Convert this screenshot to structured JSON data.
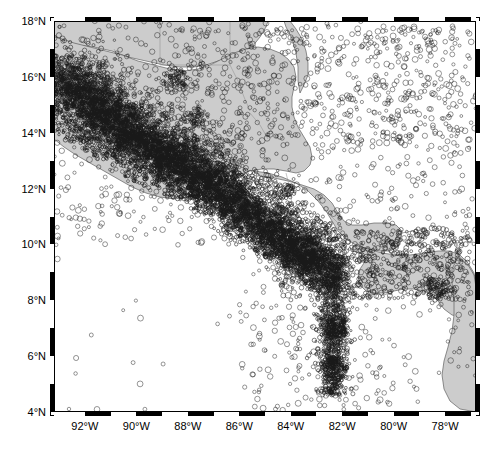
{
  "figure": {
    "kind": "seismicity-map",
    "region": "Central America",
    "background_color": "#ffffff",
    "land_color": "#cccccc",
    "coast_line_color": "#4a4a4a",
    "epicenter_symbol": "open-circle",
    "epicenter_color": "#1a1a1a"
  },
  "axes": {
    "x": {
      "label": "",
      "unit": "degrees-west",
      "min": -93.2,
      "max": -76.8,
      "tick_labels": [
        "92°W",
        "90°W",
        "88°W",
        "86°W",
        "84°W",
        "82°W",
        "80°W",
        "78°W"
      ],
      "tick_values": [
        -92,
        -90,
        -88,
        -86,
        -84,
        -82,
        -80,
        -78
      ],
      "minor_tick_interval": 1
    },
    "y": {
      "label": "",
      "unit": "degrees-north",
      "min": 4,
      "max": 18,
      "tick_labels": [
        "4°N",
        "6°N",
        "8°N",
        "10°N",
        "12°N",
        "14°N",
        "16°N",
        "18°N"
      ],
      "tick_values": [
        4,
        6,
        8,
        10,
        12,
        14,
        16,
        18
      ],
      "minor_tick_interval": 1
    }
  },
  "chart_data": {
    "type": "scatter",
    "title": "",
    "xlabel": "",
    "ylabel": "",
    "xlim": [
      -93.2,
      -76.8
    ],
    "ylim": [
      4,
      18
    ],
    "grid": false,
    "legend": null,
    "series": [
      {
        "name": "Earthquake epicenters",
        "marker": "o",
        "filled": false,
        "color": "#1a1a1a",
        "description": "Dense NW-SE band of epicenters along the Middle America Trench from 16°N/93°W to 10°N/84°W, a N-S strand near 82°W from 5°N to 10°N, and scattered events across the Caribbean and Pacific.",
        "clusters": [
          {
            "center_lon": -92.2,
            "center_lat": 15.0,
            "radius_deg": 1.6,
            "count": 900,
            "density": "very-high"
          },
          {
            "center_lon": -91.0,
            "center_lat": 14.2,
            "radius_deg": 1.4,
            "count": 800,
            "density": "very-high"
          },
          {
            "center_lon": -89.6,
            "center_lat": 13.2,
            "radius_deg": 1.3,
            "count": 700,
            "density": "very-high"
          },
          {
            "center_lon": -88.2,
            "center_lat": 12.6,
            "radius_deg": 1.2,
            "count": 620,
            "density": "very-high"
          },
          {
            "center_lon": -86.9,
            "center_lat": 11.9,
            "radius_deg": 1.1,
            "count": 560,
            "density": "high"
          },
          {
            "center_lon": -85.8,
            "center_lat": 11.0,
            "radius_deg": 1.0,
            "count": 460,
            "density": "high"
          },
          {
            "center_lon": -84.7,
            "center_lat": 10.2,
            "radius_deg": 0.9,
            "count": 380,
            "density": "high"
          },
          {
            "center_lon": -83.6,
            "center_lat": 9.6,
            "radius_deg": 0.8,
            "count": 330,
            "density": "high"
          },
          {
            "center_lon": -82.8,
            "center_lat": 9.1,
            "radius_deg": 0.9,
            "count": 420,
            "density": "very-high"
          },
          {
            "center_lon": -82.3,
            "center_lat": 7.0,
            "radius_deg": 0.5,
            "count": 260,
            "density": "medium"
          },
          {
            "center_lon": -82.3,
            "center_lat": 5.6,
            "radius_deg": 0.5,
            "count": 180,
            "density": "medium"
          },
          {
            "center_lon": -88.5,
            "center_lat": 15.9,
            "radius_deg": 0.5,
            "count": 120,
            "density": "medium"
          },
          {
            "center_lon": -87.6,
            "center_lat": 14.6,
            "radius_deg": 0.4,
            "count": 80,
            "density": "medium"
          },
          {
            "center_lon": -78.4,
            "center_lat": 8.4,
            "radius_deg": 0.5,
            "count": 110,
            "density": "medium"
          },
          {
            "center_lon": -84.1,
            "center_lat": 11.9,
            "radius_deg": 0.3,
            "count": 60,
            "density": "low"
          }
        ],
        "approx_total_points": 7000
      }
    ]
  }
}
